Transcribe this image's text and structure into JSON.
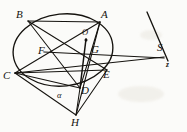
{
  "figure": {
    "kind": "euclidean-geometry-diagram",
    "caption": "",
    "canvas": {
      "width": 187,
      "height": 132
    },
    "style": {
      "background": "#fbfbf9",
      "ink": "#15130f",
      "stroke_width": 1.0,
      "circle_stroke_width": 1.3
    },
    "circle": {
      "name": "circumcircle",
      "cx": 63,
      "cy": 50,
      "rx": 50,
      "ry": 36,
      "rotation_deg": -6
    },
    "points": {
      "A": {
        "x": 100,
        "y": 22,
        "label": "A",
        "label_x": 101,
        "label_y": 9,
        "dot": false
      },
      "B": {
        "x": 28,
        "y": 21,
        "label": "B",
        "label_x": 16,
        "label_y": 9,
        "dot": false
      },
      "C": {
        "x": 15,
        "y": 73,
        "label": "C",
        "label_x": 4,
        "label_y": 71,
        "dot": false
      },
      "D": {
        "x": 80,
        "y": 88,
        "label": "D",
        "label_x": 82,
        "label_y": 85,
        "dot": false
      },
      "E": {
        "x": 107,
        "y": 70,
        "label": "E",
        "label_x": 104,
        "label_y": 70,
        "dot": false
      },
      "F": {
        "x": 44,
        "y": 52,
        "label": "F",
        "label_x": 38,
        "label_y": 47,
        "dot": false
      },
      "G": {
        "x": 89,
        "y": 53,
        "label": "G",
        "label_x": 91,
        "label_y": 45,
        "dot": false
      },
      "H": {
        "x": 76,
        "y": 115,
        "label": "H",
        "label_x": 71,
        "label_y": 117,
        "dot": false
      },
      "O": {
        "x": 86,
        "y": 39,
        "label": "O",
        "label_x": 84,
        "label_y": 30,
        "dot": true
      },
      "S": {
        "x": 161,
        "y": 54,
        "label": "S",
        "label_x": 158,
        "label_y": 43,
        "dot": false
      }
    },
    "angle_marks": [
      {
        "name": "alpha-at-D",
        "label": "α",
        "label_x": 58,
        "label_y": 92
      }
    ],
    "axis_labels": [
      {
        "name": "z-axis-label",
        "label": "z",
        "label_x": 167,
        "label_y": 62
      }
    ],
    "segments": [
      {
        "name": "chord-B-A",
        "from": "B",
        "to": "A"
      },
      {
        "name": "chord-B-D",
        "from": "B",
        "to": "D"
      },
      {
        "name": "chord-B-E",
        "from": "B",
        "to": "E"
      },
      {
        "name": "chord-C-A",
        "from": "C",
        "to": "A"
      },
      {
        "name": "chord-C-E",
        "from": "C",
        "to": "E"
      },
      {
        "name": "chord-C-D",
        "from": "C",
        "to": "D"
      },
      {
        "name": "chord-A-D",
        "from": "A",
        "to": "D"
      },
      {
        "name": "chord-A-H",
        "from": "A",
        "to": "H"
      },
      {
        "name": "segment-C-H",
        "from": "C",
        "to": "H"
      },
      {
        "name": "segment-D-H",
        "from": "D",
        "to": "H"
      },
      {
        "name": "segment-E-H",
        "from": "E",
        "to": "H"
      },
      {
        "name": "segment-O-D",
        "from": "O",
        "to": "D"
      },
      {
        "name": "segment-F-S",
        "from": "F",
        "to": "S"
      },
      {
        "name": "segment-C-S",
        "from": "C",
        "to": "S"
      }
    ],
    "rays": [
      {
        "name": "ray-S-upper",
        "x1": 147,
        "y1": 12,
        "x2": 167,
        "y2": 60
      }
    ]
  }
}
